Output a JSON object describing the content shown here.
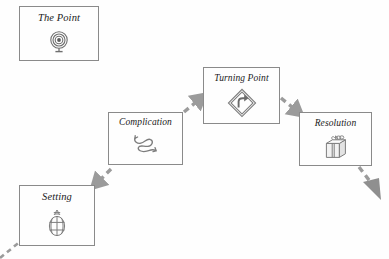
{
  "diagram": {
    "type": "flowchart",
    "background_color": "#fefefe",
    "node_border_color": "#8a8a8a",
    "connector_color": "#9b9b9b",
    "icon_line_color": "#7d7d7d",
    "nodes": [
      {
        "id": "point",
        "label": "The Point",
        "icon": "target-bullseye-icon",
        "x": 19,
        "y": 6,
        "w": 80,
        "h": 55
      },
      {
        "id": "setting",
        "label": "Setting",
        "icon": "hot-air-balloon-icon",
        "x": 19,
        "y": 185,
        "w": 76,
        "h": 61
      },
      {
        "id": "complication",
        "label": "Complication",
        "icon": "tangled-knot-icon",
        "x": 108,
        "y": 112,
        "w": 75,
        "h": 53
      },
      {
        "id": "turning_point",
        "label": "Turning Point",
        "icon": "turn-right-road-sign-icon",
        "x": 203,
        "y": 67,
        "w": 77,
        "h": 57
      },
      {
        "id": "resolution",
        "label": "Resolution",
        "icon": "gift-box-icon",
        "x": 299,
        "y": 112,
        "w": 73,
        "h": 54
      }
    ],
    "connectors": [
      {
        "id": "inbound-setting",
        "from": "offscreen-bottom-left",
        "to": "setting",
        "style": "dashed",
        "arrowhead": false
      },
      {
        "id": "setting-to-complication",
        "from": "setting",
        "to": "complication",
        "style": "dashed",
        "arrowhead": true
      },
      {
        "id": "complication-to-turning-point",
        "from": "complication",
        "to": "turning_point",
        "style": "dashed",
        "arrowhead": true
      },
      {
        "id": "turning-point-to-resolution",
        "from": "turning_point",
        "to": "resolution",
        "style": "dashed",
        "arrowhead": true
      },
      {
        "id": "resolution-outbound",
        "from": "resolution",
        "to": "offscreen-bottom-right",
        "style": "dashed",
        "arrowhead": true
      }
    ]
  }
}
